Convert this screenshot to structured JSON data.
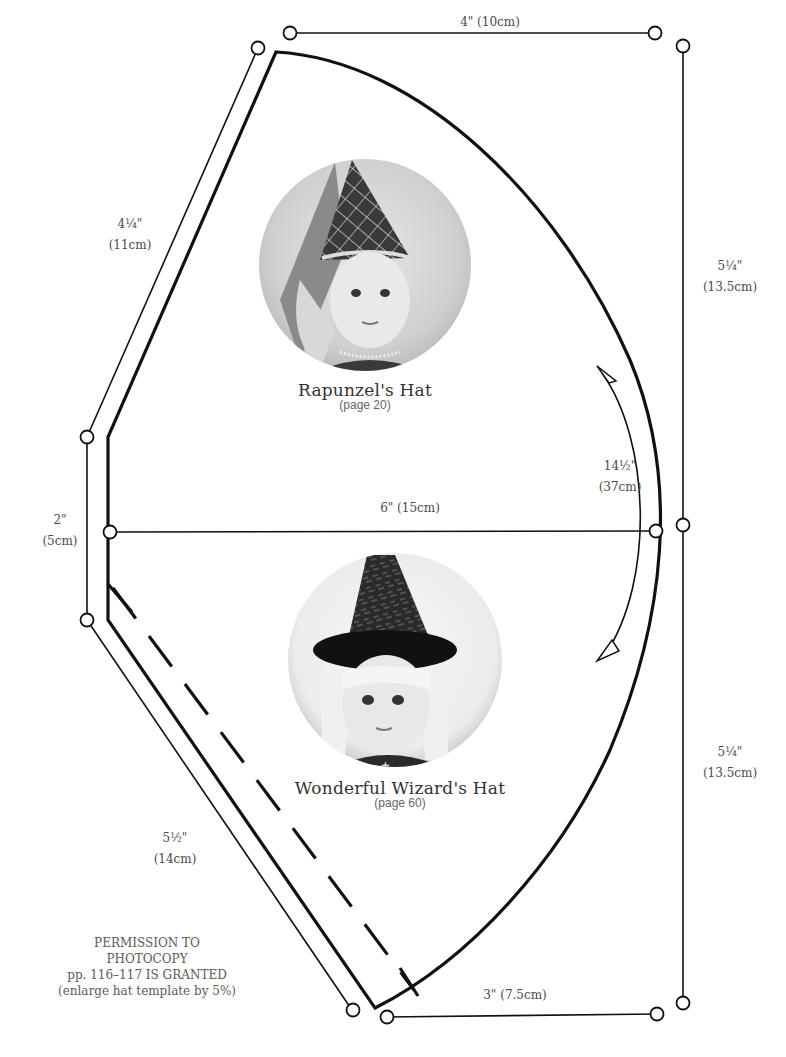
{
  "pattern": {
    "title": "Hat template",
    "colors": {
      "line": "#111111",
      "text": "#4a4a4a",
      "background": "#ffffff"
    }
  },
  "dimensions": {
    "top": {
      "value": "4\" (10cm)"
    },
    "upper_left_slant": {
      "inches": "4¼\"",
      "cm": "(11cm)"
    },
    "right_upper": {
      "inches": "5¼\"",
      "cm": "(13.5cm)"
    },
    "right_lower": {
      "inches": "5¼\"",
      "cm": "(13.5cm)"
    },
    "left_vertical": {
      "inches": "2\"",
      "cm": "(5cm)"
    },
    "middle_horizontal": {
      "value": "6\" (15cm)"
    },
    "arc": {
      "inches": "14½\"",
      "cm": "(37cm)"
    },
    "lower_left_slant": {
      "inches": "5½\"",
      "cm": "(14cm)"
    },
    "bottom": {
      "value": "3\" (7.5cm)"
    }
  },
  "photos": [
    {
      "title": "Rapunzel's Hat",
      "page": "(page 20)",
      "subject": "doll wearing pointed princess hat with veil"
    },
    {
      "title": "Wonderful Wizard's Hat",
      "page": "(page 60)",
      "subject": "doll wearing wizard hat with fur trim"
    }
  ],
  "permission": {
    "line1": "PERMISSION TO PHOTOCOPY",
    "line2": "pp. 116–117 IS GRANTED",
    "line3": "(enlarge hat template by 5%)"
  }
}
